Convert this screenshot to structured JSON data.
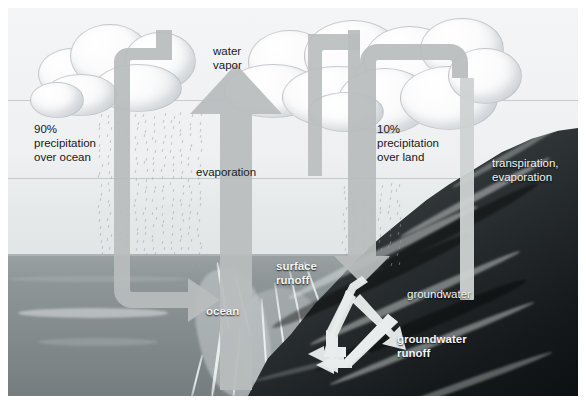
{
  "diagram": {
    "labels": {
      "water_vapor": "water\nvapor",
      "precip_ocean": "90%\nprecipitation\nover ocean",
      "evaporation": "evaporation",
      "precip_land": "10%\nprecipitation\nover land",
      "transpiration": "transpiration,\nevaporation",
      "surface_runoff": "surface\nrunoff",
      "ocean": "ocean",
      "groundwater": "groundwater",
      "groundwater_runoff": "groundwater\nrunoff"
    },
    "colors": {
      "arrow_gray": "#b9bcbd",
      "arrow_white": "#e9ecec",
      "sky": "#eef0f1",
      "ocean": "#878e90",
      "land": "#23282a",
      "text_dark": "#17191a",
      "text_light": "#f2f5f5",
      "background": "#ffffff"
    },
    "flows": [
      {
        "name": "precipitation-over-ocean",
        "value": "90%",
        "direction": "cloud-to-ocean"
      },
      {
        "name": "precipitation-over-land",
        "value": "10%",
        "direction": "cloud-to-land"
      },
      {
        "name": "evaporation",
        "value": "",
        "direction": "ocean-to-sky"
      },
      {
        "name": "transpiration-evaporation",
        "value": "",
        "direction": "land-to-sky"
      },
      {
        "name": "surface-runoff",
        "value": "",
        "direction": "land-to-ocean"
      },
      {
        "name": "groundwater",
        "value": "",
        "direction": "downward-into-land"
      },
      {
        "name": "groundwater-runoff",
        "value": "",
        "direction": "land-to-ocean"
      }
    ]
  }
}
